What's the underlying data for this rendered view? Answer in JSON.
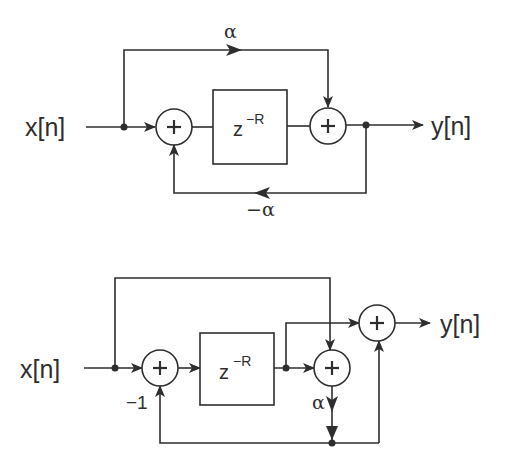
{
  "diagrams": [
    {
      "id": "top",
      "input_label": "x[n]",
      "output_label": "y[n]",
      "delay_base": "z",
      "delay_exp": "−R",
      "feedforward_gain": "α",
      "feedback_gain": "−α",
      "adder_symbol": "+"
    },
    {
      "id": "bottom",
      "input_label": "x[n]",
      "output_label": "y[n]",
      "delay_base": "z",
      "delay_exp": "−R",
      "feedback_gain": "−1",
      "branch_gain": "α",
      "adder_symbol": "+"
    }
  ],
  "colors": {
    "line": "#2e2e2e",
    "background": "#ffffff"
  }
}
